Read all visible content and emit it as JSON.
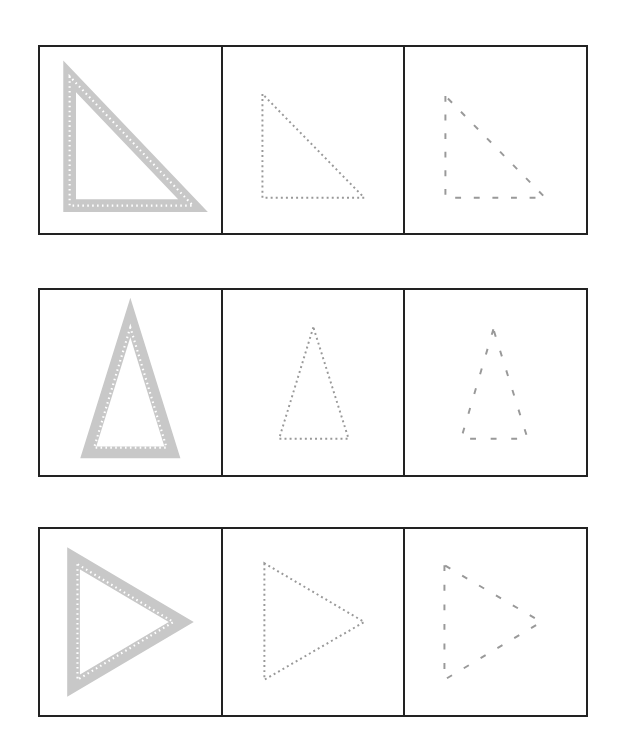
{
  "worksheet": {
    "title": "Triangle tracing worksheet",
    "colors": {
      "border": "#222222",
      "shape_fill": "#c8c8c8",
      "trace_line": "#999999",
      "dot": "#ffffff"
    },
    "rows": [
      {
        "shape": "right-triangle",
        "cells": [
          {
            "style": "thick-outline-with-dots"
          },
          {
            "style": "dotted"
          },
          {
            "style": "dashed"
          }
        ]
      },
      {
        "shape": "isosceles-triangle",
        "cells": [
          {
            "style": "thick-outline-with-dots"
          },
          {
            "style": "dotted"
          },
          {
            "style": "dashed"
          }
        ]
      },
      {
        "shape": "right-pointing-triangle",
        "cells": [
          {
            "style": "thick-outline-with-dots"
          },
          {
            "style": "dotted"
          },
          {
            "style": "dashed"
          }
        ]
      }
    ]
  }
}
